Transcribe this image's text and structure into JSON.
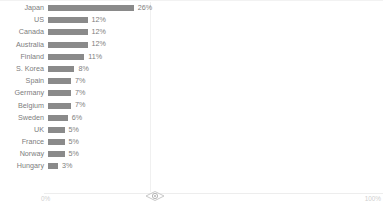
{
  "chart_data": {
    "type": "bar",
    "orientation": "horizontal",
    "title": "",
    "subtitle": "",
    "xlabel": "",
    "ylabel": "",
    "xlim": [
      0,
      100
    ],
    "grid": true,
    "legend": null,
    "value_suffix": "%",
    "categories": [
      "Japan",
      "US",
      "Canada",
      "Australia",
      "Finland",
      "S. Korea",
      "Spain",
      "Germany",
      "Belgium",
      "Sweden",
      "UK",
      "France",
      "Norway",
      "Hungary"
    ],
    "values": [
      26,
      12,
      12,
      12,
      11,
      8,
      7,
      7,
      7,
      6,
      5,
      5,
      5,
      3
    ],
    "value_labels": [
      "26%",
      "12%",
      "12%",
      "12%",
      "11%",
      "8%",
      "7%",
      "7%",
      "7%",
      "6%",
      "5%",
      "5%",
      "5%",
      "3%"
    ],
    "axis_tick_labels": [
      "0%",
      "100%"
    ]
  },
  "axis": {
    "left_tick": "0%",
    "right_tick": "100%"
  },
  "style": {
    "bar_color": "#8a8a8a",
    "label_color": "#7d7d7d",
    "axis_color": "#ededed",
    "gridline_color": "#f0f0f0",
    "tick_label_color": "#cfcfcf",
    "background": "#ffffff"
  }
}
